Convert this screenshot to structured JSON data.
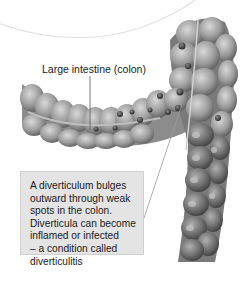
{
  "figure": {
    "type": "anatomical-illustration",
    "color_mode": "grayscale",
    "background": "#ffffff",
    "labels": {
      "colon": "Large intestine (colon)"
    },
    "callout": {
      "lines": [
        "A diverticulum bulges",
        "outward through weak",
        "spots in the colon.",
        "Diverticula can become",
        "inflamed or infected",
        "– a condition called",
        "diverticulitis"
      ],
      "background": "#e4e4e4"
    }
  }
}
